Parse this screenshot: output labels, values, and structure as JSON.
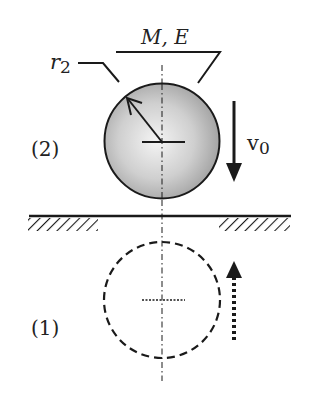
{
  "diagram": {
    "type": "physics-schematic",
    "labels": {
      "mass_modulus": "M, E",
      "radius_symbol": "r",
      "radius_subscript": "2",
      "velocity_symbol": "v",
      "velocity_subscript": "0",
      "state_upper": "(2)",
      "state_lower": "(1)"
    },
    "elements": {
      "upper_sphere": {
        "state": "(2)",
        "style": "solid, gray radial shading",
        "direction": "down"
      },
      "lower_sphere": {
        "state": "(1)",
        "style": "dashed outline",
        "direction": "up"
      },
      "surface": {
        "style": "horizontal line with hatched ground at both ends",
        "gap": "center"
      },
      "center_axis": {
        "style": "dash-dot vertical line"
      }
    },
    "colors": {
      "stroke": "#1a1a1a",
      "sphere_light": "#f4f4f4",
      "sphere_dark": "#9a9a9a",
      "background": "#ffffff"
    }
  }
}
